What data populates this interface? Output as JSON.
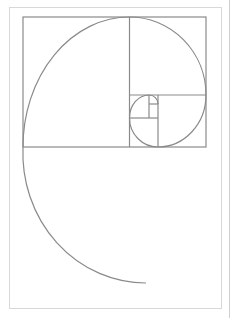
{
  "diagram": {
    "type": "golden-spiral",
    "title": "",
    "colors": {
      "line": "#8a8a8a",
      "frame": "#d8d8d8",
      "background": "#ffffff"
    },
    "squares_visible": 7
  }
}
